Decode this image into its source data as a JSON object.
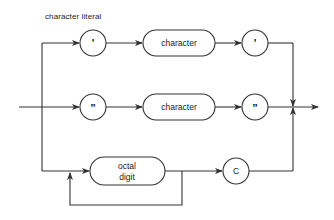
{
  "diagram": {
    "title": "character literal",
    "type": "syntax-railroad-diagram",
    "rows": [
      {
        "id": "single-quote-path",
        "nodes": [
          {
            "shape": "circle",
            "label": "'"
          },
          {
            "shape": "pill",
            "label": "character"
          },
          {
            "shape": "circle",
            "label": "'"
          }
        ]
      },
      {
        "id": "double-quote-path",
        "nodes": [
          {
            "shape": "circle",
            "label": "”"
          },
          {
            "shape": "pill",
            "label": "character"
          },
          {
            "shape": "circle",
            "label": "”"
          }
        ]
      },
      {
        "id": "octal-path",
        "nodes": [
          {
            "shape": "pill",
            "label_line1": "octal",
            "label_line2": "digit",
            "loop": true
          },
          {
            "shape": "circle",
            "label": "C"
          }
        ]
      }
    ],
    "line_color": "#333333"
  }
}
